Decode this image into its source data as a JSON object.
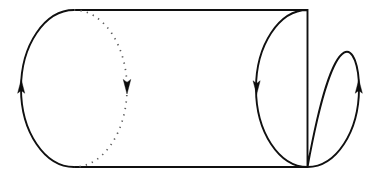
{
  "figure": {
    "title": "Oriented cylinder with boundary circles",
    "canvas": {
      "width": 376,
      "height": 180,
      "background": "#ffffff"
    },
    "colors": {
      "solid_stroke": "#101010",
      "hidden_stroke": "#5d5d5d",
      "arrow_fill": "#0c0c0c",
      "background": "#ffffff"
    },
    "shapes": {
      "left_circle": {
        "name": "left-boundary-circle",
        "center_x": 74,
        "center_y": 88.5,
        "radius_x": 53,
        "radius_y": 78.5,
        "front_half": "solid",
        "back_half": "dotted",
        "orientation": "counterclockwise"
      },
      "right_circle": {
        "name": "right-boundary-circle",
        "center_x": 307.5,
        "center_y": 88.5,
        "radius_x": 51.5,
        "radius_y": 78.5,
        "front_half": "solid",
        "back_half": "solid",
        "orientation": "clockwise"
      },
      "top_ruling": {
        "name": "top-ruling-line",
        "x1": 74,
        "y1": 10,
        "x2": 307.5,
        "y2": 10
      },
      "bottom_ruling": {
        "name": "bottom-ruling-line",
        "x1": 74,
        "y1": 167,
        "x2": 307.5,
        "y2": 167
      }
    },
    "arrows": [
      {
        "name": "left-circle-up-arrow",
        "x": 21.2,
        "y": 88,
        "direction": "up",
        "size": 8.5
      },
      {
        "name": "left-circle-down-arrow",
        "x": 127.0,
        "y": 85,
        "direction": "down",
        "size": 9.0
      },
      {
        "name": "right-circle-down-arrow",
        "x": 256.6,
        "y": 86,
        "direction": "down",
        "size": 8.5
      },
      {
        "name": "right-circle-up-arrow",
        "x": 358.8,
        "y": 88,
        "direction": "up",
        "size": 8.5
      }
    ]
  }
}
